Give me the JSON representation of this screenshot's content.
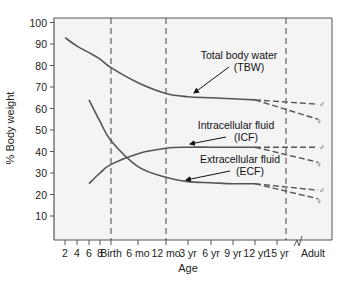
{
  "chart_data": {
    "type": "line",
    "title": "",
    "xlabel": "Age",
    "ylabel": "% Body weight",
    "ylim": [
      0,
      100
    ],
    "yticks": [
      10,
      20,
      30,
      40,
      50,
      60,
      70,
      80,
      90,
      100
    ],
    "x_categories": [
      "2",
      "4",
      "6",
      "8",
      "Birth",
      "6 mo",
      "12 mo",
      "3 yr",
      "6 yr",
      "9 yr",
      "12 yr",
      "15 yr",
      "Adult"
    ],
    "x_units_note": "fetal months 2-8, then Birth, infancy, childhood; axis break before Adult",
    "reference_lines_at": [
      "Birth",
      "12 mo",
      "Adult boundary"
    ],
    "grid": false,
    "series": [
      {
        "name": "Total body water",
        "abbr": "TBW",
        "label_line1": "Total body water",
        "label_line2": "(TBW)",
        "points": [
          [
            "2",
            93
          ],
          [
            "4",
            89
          ],
          [
            "6",
            86
          ],
          [
            "8",
            83
          ],
          [
            "Birth",
            79
          ],
          [
            "6 mo",
            72
          ],
          [
            "12 mo",
            67
          ],
          [
            "3 yr",
            65.5
          ],
          [
            "6 yr",
            65
          ],
          [
            "9 yr",
            64.5
          ],
          [
            "12 yr",
            64
          ]
        ],
        "adult_male": 62,
        "adult_female": 55
      },
      {
        "name": "Intracellular fluid",
        "abbr": "ICF",
        "label_line1": "Intracellular fluid",
        "label_line2": "(ICF)",
        "points": [
          [
            "6",
            25
          ],
          [
            "8",
            30
          ],
          [
            "Birth",
            34
          ],
          [
            "6 mo",
            39
          ],
          [
            "12 mo",
            41.5
          ],
          [
            "3 yr",
            42
          ],
          [
            "6 yr",
            42
          ],
          [
            "9 yr",
            42
          ],
          [
            "12 yr",
            42
          ]
        ],
        "adult_male": 42,
        "adult_female": 35
      },
      {
        "name": "Extracellular fluid",
        "abbr": "ECF",
        "label_line1": "Extracellular fluid",
        "label_line2": "(ECF)",
        "points": [
          [
            "6",
            64
          ],
          [
            "8",
            54
          ],
          [
            "Birth",
            45
          ],
          [
            "6 mo",
            33
          ],
          [
            "12 mo",
            28
          ],
          [
            "3 yr",
            26
          ],
          [
            "6 yr",
            25.5
          ],
          [
            "9 yr",
            25
          ],
          [
            "12 yr",
            25
          ]
        ],
        "adult_male": 22,
        "adult_female": 18
      }
    ],
    "adult_symbols": {
      "male": "♂",
      "female": "♀"
    },
    "colors": {
      "line": "#555555",
      "frame": "#555555",
      "plot_bg": "#f4f4f4",
      "text": "#222222"
    }
  }
}
